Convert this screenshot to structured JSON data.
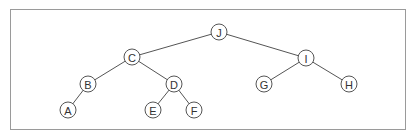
{
  "diagram": {
    "type": "binary-tree",
    "frame": {
      "border_color": "#9a9a9a"
    },
    "node_radius": 8,
    "colors": {
      "stroke": "#555555",
      "fill": "#ffffff",
      "text": "#333333"
    },
    "nodes": [
      {
        "id": "J",
        "label": "J",
        "x": 219,
        "y": 32
      },
      {
        "id": "C",
        "label": "C",
        "x": 132,
        "y": 57
      },
      {
        "id": "I",
        "label": "I",
        "x": 306,
        "y": 58
      },
      {
        "id": "B",
        "label": "B",
        "x": 88,
        "y": 84
      },
      {
        "id": "D",
        "label": "D",
        "x": 174,
        "y": 84
      },
      {
        "id": "G",
        "label": "G",
        "x": 264,
        "y": 84
      },
      {
        "id": "H",
        "label": "H",
        "x": 349,
        "y": 84
      },
      {
        "id": "A",
        "label": "A",
        "x": 68,
        "y": 110
      },
      {
        "id": "E",
        "label": "E",
        "x": 153,
        "y": 110
      },
      {
        "id": "F",
        "label": "F",
        "x": 194,
        "y": 110
      }
    ],
    "edges": [
      {
        "from": "J",
        "to": "C"
      },
      {
        "from": "J",
        "to": "I"
      },
      {
        "from": "C",
        "to": "B"
      },
      {
        "from": "C",
        "to": "D"
      },
      {
        "from": "B",
        "to": "A"
      },
      {
        "from": "D",
        "to": "E"
      },
      {
        "from": "D",
        "to": "F"
      },
      {
        "from": "I",
        "to": "G"
      },
      {
        "from": "I",
        "to": "H"
      }
    ]
  }
}
